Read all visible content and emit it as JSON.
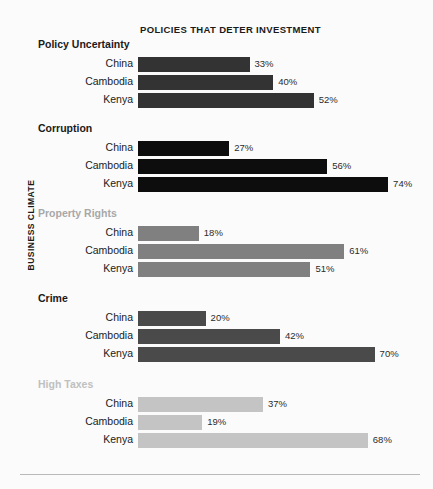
{
  "chart_data": {
    "type": "bar",
    "orientation": "horizontal",
    "title": "POLICIES THAT DETER INVESTMENT",
    "ylabel": "BUSINESS CLIMATE",
    "xlabel": "",
    "grid": false,
    "legend": "none",
    "xlim": [
      0,
      80
    ],
    "value_suffix": "%",
    "categories": [
      "China",
      "Cambodia",
      "Kenya"
    ],
    "groups": [
      {
        "name": "Policy Uncertainty",
        "color": "#333333",
        "header_color": "#1a1a1a",
        "values": [
          33,
          40,
          52
        ],
        "labels": [
          "33%",
          "40%",
          "52%"
        ]
      },
      {
        "name": "Corruption",
        "color": "#0d0d0d",
        "header_color": "#1a1a1a",
        "values": [
          27,
          56,
          74
        ],
        "labels": [
          "27%",
          "56%",
          "74%"
        ]
      },
      {
        "name": "Property Rights",
        "color": "#808080",
        "header_color": "#a8a8a8",
        "values": [
          18,
          61,
          51
        ],
        "labels": [
          "18%",
          "61%",
          "51%"
        ]
      },
      {
        "name": "Crime",
        "color": "#4a4a4a",
        "header_color": "#1a1a1a",
        "values": [
          20,
          42,
          70
        ],
        "labels": [
          "20%",
          "42%",
          "70%"
        ]
      },
      {
        "name": "High Taxes",
        "color": "#c4c4c4",
        "header_color": "#c0c0c0",
        "values": [
          37,
          19,
          68
        ],
        "labels": [
          "37%",
          "19%",
          "68%"
        ]
      }
    ]
  },
  "layout": {
    "bar_origin_x": 138,
    "px_per_percent": 3.38,
    "group_tops": [
      38,
      122,
      207,
      292,
      378
    ],
    "row_offset": 18,
    "row_pitch": 18
  }
}
